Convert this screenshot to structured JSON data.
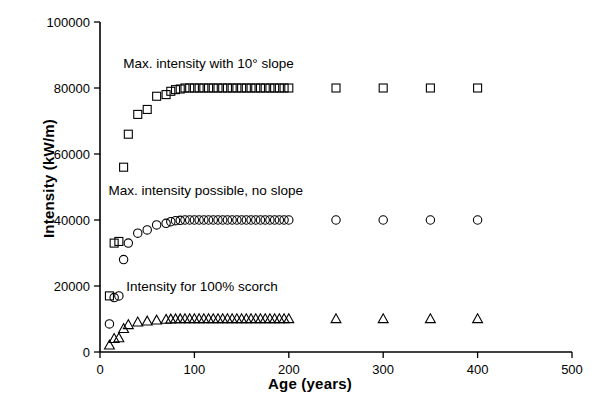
{
  "chart_data": {
    "type": "scatter",
    "title": "",
    "xlabel": "Age (years)",
    "ylabel": "Intensity (kW/m)",
    "xlim": [
      0,
      500
    ],
    "ylim": [
      0,
      100000
    ],
    "xticks": [
      0,
      100,
      200,
      300,
      400,
      500
    ],
    "yticks": [
      0,
      20000,
      40000,
      60000,
      80000,
      100000
    ],
    "xtick_labels": [
      "0",
      "100",
      "200",
      "300",
      "400",
      "500"
    ],
    "ytick_labels": [
      "0",
      "20000",
      "40000",
      "60000",
      "80000",
      "100000"
    ],
    "grid": false,
    "legend": "inline-annotations",
    "series": [
      {
        "name": "Max. intensity with 10° slope",
        "marker": "square",
        "annotation": "Max. intensity with 10° slope",
        "annotation_x": 115,
        "annotation_y": 86000,
        "x": [
          10,
          15,
          20,
          25,
          30,
          40,
          50,
          60,
          70,
          75,
          80,
          85,
          90,
          95,
          100,
          105,
          110,
          115,
          120,
          125,
          130,
          135,
          140,
          145,
          150,
          155,
          160,
          165,
          170,
          175,
          180,
          185,
          190,
          195,
          200,
          250,
          300,
          350,
          400
        ],
        "y": [
          17000,
          33000,
          33500,
          56000,
          66000,
          72000,
          73500,
          77500,
          78000,
          79000,
          79500,
          79700,
          80000,
          80000,
          80000,
          80000,
          80000,
          80000,
          80000,
          80000,
          80000,
          80000,
          80000,
          80000,
          80000,
          80000,
          80000,
          80000,
          80000,
          80000,
          80000,
          80000,
          80000,
          80000,
          80000,
          80000,
          80000,
          80000,
          80000
        ]
      },
      {
        "name": "Max. intensity possible, no slope",
        "marker": "circle",
        "annotation": "Max. intensity possible, no slope",
        "annotation_x": 112,
        "annotation_y": 47500,
        "x": [
          10,
          15,
          20,
          25,
          30,
          40,
          50,
          60,
          70,
          75,
          80,
          85,
          90,
          95,
          100,
          105,
          110,
          115,
          120,
          125,
          130,
          135,
          140,
          145,
          150,
          155,
          160,
          165,
          170,
          175,
          180,
          185,
          190,
          195,
          200,
          250,
          300,
          350,
          400
        ],
        "y": [
          8500,
          16500,
          17000,
          28000,
          33000,
          36000,
          37000,
          38500,
          39000,
          39500,
          39800,
          39900,
          40000,
          40000,
          40000,
          40000,
          40000,
          40000,
          40000,
          40000,
          40000,
          40000,
          40000,
          40000,
          40000,
          40000,
          40000,
          40000,
          40000,
          40000,
          40000,
          40000,
          40000,
          40000,
          40000,
          40000,
          40000,
          40000,
          40000
        ]
      },
      {
        "name": "Intensity for 100% scorch",
        "marker": "triangle",
        "annotation": "Intensity for 100% scorch",
        "annotation_x": 108,
        "annotation_y": 18500,
        "x": [
          10,
          15,
          20,
          25,
          30,
          40,
          50,
          60,
          70,
          75,
          80,
          85,
          90,
          95,
          100,
          105,
          110,
          115,
          120,
          125,
          130,
          135,
          140,
          145,
          150,
          155,
          160,
          165,
          170,
          175,
          180,
          185,
          190,
          195,
          200,
          250,
          300,
          350,
          400
        ],
        "y": [
          2000,
          4000,
          4200,
          7000,
          8200,
          9000,
          9300,
          9600,
          9800,
          9900,
          9950,
          9980,
          10000,
          10000,
          10000,
          10000,
          10000,
          10000,
          10000,
          10000,
          10000,
          10000,
          10000,
          10000,
          10000,
          10000,
          10000,
          10000,
          10000,
          10000,
          10000,
          10000,
          10000,
          10000,
          10000,
          10000,
          10000,
          10000,
          10000
        ]
      }
    ]
  }
}
